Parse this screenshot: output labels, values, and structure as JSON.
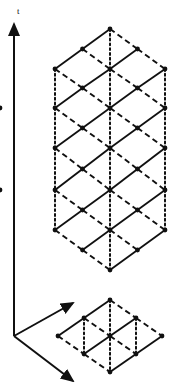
{
  "figure": {
    "background_color": "#ffffff",
    "ink_color": "#101010"
  },
  "axes": {
    "time_axis": {
      "label": "t",
      "label_position": {
        "x": 17,
        "y": 14
      },
      "origin": {
        "x": 14,
        "y": 336
      },
      "tip": {
        "x": 14,
        "y": 24
      },
      "style": "solid",
      "arrow": "true"
    },
    "space_axis_1": {
      "label": "",
      "origin": {
        "x": 14,
        "y": 336
      },
      "tip": {
        "x": 73,
        "y": 303
      },
      "style": "solid",
      "arrow": "true"
    },
    "space_axis_2": {
      "label": "",
      "origin": {
        "x": 14,
        "y": 336
      },
      "tip": {
        "x": 73,
        "y": 381
      },
      "style": "solid",
      "arrow": "true"
    }
  },
  "chart_data": {
    "type": "scatter",
    "xlabel": "",
    "ylabel": "t",
    "grid": "off",
    "legend": "none",
    "geometry": {
      "center_x": 110,
      "row_spacing": 39.5,
      "column_spacing": 27.5,
      "node_radius": 2.4
    },
    "line_styles": {
      "solid": "solid",
      "dashed": "dashed",
      "dotted": "dotted"
    },
    "upper_lattice": {
      "name": "stacked-diamond-lattice",
      "rows": [
        {
          "index": 0,
          "y": 29,
          "columns": [
            0
          ]
        },
        {
          "index": 1,
          "y": 69,
          "columns": [
            -2,
            0,
            2
          ]
        },
        {
          "index": 2,
          "y": 108,
          "columns": [
            -4,
            -2,
            0,
            2,
            4
          ]
        },
        {
          "index": 3,
          "y": 148,
          "columns": [
            -2,
            0,
            2
          ]
        },
        {
          "index": 4,
          "y": 190,
          "columns": [
            -4,
            -2,
            0,
            2,
            4
          ]
        },
        {
          "index": 5,
          "y": 230,
          "columns": [
            -2,
            0,
            2
          ]
        },
        {
          "index": 6,
          "y": 270,
          "columns": [
            0
          ]
        }
      ],
      "extra_rows": [
        {
          "index": 1.5,
          "y": 88,
          "columns": [
            -1,
            1
          ]
        },
        {
          "index": 2.5,
          "y": 128,
          "columns": [
            -1,
            1
          ]
        },
        {
          "index": 3.5,
          "y": 169,
          "columns": [
            -1,
            1
          ]
        },
        {
          "index": 4.5,
          "y": 210,
          "columns": [
            -1,
            1
          ]
        },
        {
          "index": 0.5,
          "y": 49,
          "columns": [
            -1,
            1
          ]
        },
        {
          "index": 5.5,
          "y": 250,
          "columns": [
            -1,
            1
          ]
        }
      ],
      "vertical_dotted_columns": [
        -2,
        0,
        2
      ],
      "node_count": 31
    },
    "base_lattice": {
      "name": "planar-rhombic-lattice",
      "center": {
        "x": 110,
        "y": 336
      },
      "half_width": 52,
      "half_height": 36,
      "divisions": 2,
      "node_count": 9,
      "nodes": [
        {
          "row": 0,
          "col": 0,
          "x": 110,
          "y": 300
        },
        {
          "row": 0,
          "col": 1,
          "x": 136,
          "y": 318
        },
        {
          "row": 0,
          "col": -1,
          "x": 84,
          "y": 318
        },
        {
          "row": 1,
          "col": 0,
          "x": 110,
          "y": 336
        },
        {
          "row": 1,
          "col": 1,
          "x": 162,
          "y": 336
        },
        {
          "row": 1,
          "col": -1,
          "x": 58,
          "y": 336
        },
        {
          "row": 2,
          "col": 0,
          "x": 110,
          "y": 372
        },
        {
          "row": 2,
          "col": 1,
          "x": 136,
          "y": 354
        },
        {
          "row": 2,
          "col": -1,
          "x": 84,
          "y": 354
        }
      ]
    }
  }
}
